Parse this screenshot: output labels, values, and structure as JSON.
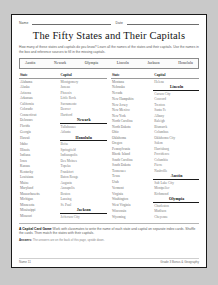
{
  "header": {
    "name_label": "Name",
    "date_label": "Date"
  },
  "title": "The Fifty States and Their Capitals",
  "intro": "How many of these states and capitals do you know? Learn all the names of the states and their capitals. Use the names in the box and reference sources to fill in the missing capitals.",
  "word_bank": [
    "Austin",
    "Newark",
    "Olympia",
    "Lincoln",
    "Jackson",
    "Honolulu"
  ],
  "table": {
    "headers": [
      "State",
      "Capital",
      "State",
      "Capital"
    ],
    "left": [
      {
        "state": "Alabama",
        "capital": "Montgomery",
        "filled": false
      },
      {
        "state": "Alaska",
        "capital": "Juneau",
        "filled": false
      },
      {
        "state": "Arizona",
        "capital": "Phoenix",
        "filled": false
      },
      {
        "state": "Arkansas",
        "capital": "Little Rock",
        "filled": false
      },
      {
        "state": "California",
        "capital": "Sacramento",
        "filled": false
      },
      {
        "state": "Colorado",
        "capital": "Denver",
        "filled": false
      },
      {
        "state": "Connecticut",
        "capital": "Hartford",
        "filled": false
      },
      {
        "state": "Delaware",
        "capital": "Newark",
        "filled": true
      },
      {
        "state": "Florida",
        "capital": "Tallahassee",
        "filled": false
      },
      {
        "state": "Georgia",
        "capital": "Atlanta",
        "filled": false
      },
      {
        "state": "Hawaii",
        "capital": "Honolulu",
        "filled": true
      },
      {
        "state": "Idaho",
        "capital": "Boise",
        "filled": false
      },
      {
        "state": "Illinois",
        "capital": "Springfield",
        "filled": false
      },
      {
        "state": "Indiana",
        "capital": "Indianapolis",
        "filled": false
      },
      {
        "state": "Iowa",
        "capital": "Des Moines",
        "filled": false
      },
      {
        "state": "Kansas",
        "capital": "Topeka",
        "filled": false
      },
      {
        "state": "Kentucky",
        "capital": "Frankfort",
        "filled": false
      },
      {
        "state": "Louisiana",
        "capital": "Baton Rouge",
        "filled": false
      },
      {
        "state": "Maine",
        "capital": "Augusta",
        "filled": false
      },
      {
        "state": "Maryland",
        "capital": "Annapolis",
        "filled": false
      },
      {
        "state": "Massachusetts",
        "capital": "Boston",
        "filled": false
      },
      {
        "state": "Michigan",
        "capital": "Lansing",
        "filled": false
      },
      {
        "state": "Minnesota",
        "capital": "St. Paul",
        "filled": false
      },
      {
        "state": "Mississippi",
        "capital": "Jackson",
        "filled": true
      },
      {
        "state": "Missouri",
        "capital": "Jefferson City",
        "filled": false
      }
    ],
    "right": [
      {
        "state": "Montana",
        "capital": "Helena",
        "filled": false
      },
      {
        "state": "Nebraska",
        "capital": "Lincoln",
        "filled": true
      },
      {
        "state": "Nevada",
        "capital": "Carson City",
        "filled": false
      },
      {
        "state": "New Hampshire",
        "capital": "Concord",
        "filled": false
      },
      {
        "state": "New Jersey",
        "capital": "Trenton",
        "filled": false
      },
      {
        "state": "New Mexico",
        "capital": "Santa Fe",
        "filled": false
      },
      {
        "state": "New York",
        "capital": "Albany",
        "filled": false
      },
      {
        "state": "North Carolina",
        "capital": "Raleigh",
        "filled": false
      },
      {
        "state": "North Dakota",
        "capital": "Bismarck",
        "filled": false
      },
      {
        "state": "Ohio",
        "capital": "Columbus",
        "filled": false
      },
      {
        "state": "Oklahoma",
        "capital": "Oklahoma City",
        "filled": false
      },
      {
        "state": "Oregon",
        "capital": "Salem",
        "filled": false
      },
      {
        "state": "Pennsylvania",
        "capital": "Harrisburg",
        "filled": false
      },
      {
        "state": "Rhode Island",
        "capital": "Providence",
        "filled": false
      },
      {
        "state": "South Carolina",
        "capital": "Columbia",
        "filled": false
      },
      {
        "state": "South Dakota",
        "capital": "Pierre",
        "filled": false
      },
      {
        "state": "Tennessee",
        "capital": "Nashville",
        "filled": false
      },
      {
        "state": "Texas",
        "capital": "Austin",
        "filled": true
      },
      {
        "state": "Utah",
        "capital": "Salt Lake City",
        "filled": false
      },
      {
        "state": "Vermont",
        "capital": "Montpelier",
        "filled": false
      },
      {
        "state": "Virginia",
        "capital": "Richmond",
        "filled": false
      },
      {
        "state": "Washington",
        "capital": "Olympia",
        "filled": true
      },
      {
        "state": "West Virginia",
        "capital": "Charleston",
        "filled": false
      },
      {
        "state": "Wisconsin",
        "capital": "Madison",
        "filled": false
      },
      {
        "state": "Wyoming",
        "capital": "Cheyenne",
        "filled": false
      }
    ]
  },
  "activity": {
    "heading": "A Capital Card Game",
    "body": "Work with classmates to write the name of each state and capital on separate index cards. Shuffle the cards. Then match the states with their capitals."
  },
  "answers_note": {
    "label": "Answers:",
    "text": "The answers are on the back of this page, upside down."
  },
  "footer": {
    "page": "Name 11",
    "credit": "Grade 3 Bonus & Geography"
  }
}
